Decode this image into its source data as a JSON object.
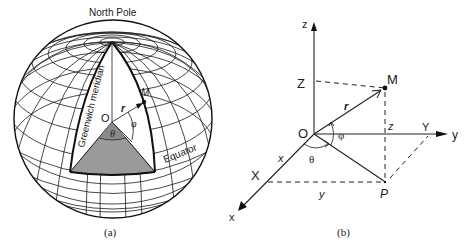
{
  "panel_a": {
    "caption": "(a)",
    "north_pole_label": "North Pole",
    "meridian_label": "Greenwich meridian",
    "equator_label": "Equator",
    "origin_label": "O",
    "point_label": "M",
    "radius_label": "r",
    "theta_label": "θ",
    "phi_label": "φ",
    "shade_color": "#9a9a9a"
  },
  "panel_b": {
    "caption": "(b)",
    "axis_z_label": "z",
    "axis_y_label": "y",
    "axis_x_label": "x",
    "Z_label": "Z",
    "Y_label": "Y",
    "X_label": "X",
    "origin_label": "O",
    "point_M_label": "M",
    "point_P_label": "P",
    "radius_label": "r",
    "phi_label": "φ",
    "theta_label": "θ",
    "x_segment_label": "x",
    "y_segment_label": "y",
    "z_segment_label": "z"
  }
}
